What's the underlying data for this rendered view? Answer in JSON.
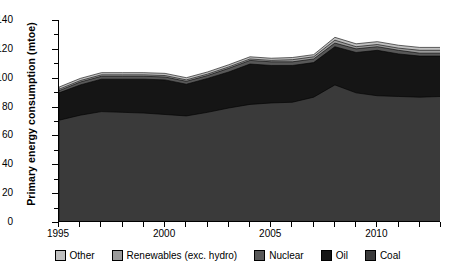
{
  "chart_data": {
    "type": "area",
    "title": "",
    "xlabel": "",
    "ylabel": "Primary energy consumption (mtoe)",
    "ylim": [
      0,
      140
    ],
    "xlim": [
      1995,
      2013
    ],
    "ytick_values": [
      0,
      20,
      40,
      60,
      80,
      100,
      120,
      140
    ],
    "xtick_values": [
      1995,
      2000,
      2005,
      2010
    ],
    "grid": false,
    "stacked": true,
    "legend_position": "bottom",
    "legend_order": [
      "Other",
      "Renewables (exc. hydro)",
      "Nuclear",
      "Oil",
      "Coal"
    ],
    "x": [
      1995,
      1996,
      1997,
      1998,
      1999,
      2000,
      2001,
      2002,
      2003,
      2004,
      2005,
      2006,
      2007,
      2008,
      2009,
      2010,
      2011,
      2012,
      2013
    ],
    "series": [
      {
        "name": "Coal",
        "color": "#3a3a3a",
        "values": [
          70.5,
          74.0,
          76.5,
          76.0,
          75.5,
          74.5,
          73.5,
          76.0,
          79.0,
          81.5,
          82.5,
          83.0,
          86.5,
          95.0,
          89.5,
          87.5,
          87.0,
          86.5,
          87.0
        ]
      },
      {
        "name": "Oil",
        "color": "#151515",
        "values": [
          19.0,
          21.0,
          22.5,
          23.0,
          23.5,
          24.0,
          22.0,
          23.5,
          25.0,
          28.0,
          26.0,
          25.5,
          24.0,
          26.5,
          28.0,
          31.5,
          29.5,
          28.5,
          28.0
        ]
      },
      {
        "name": "Nuclear",
        "color": "#585858",
        "values": [
          1.5,
          2.0,
          2.0,
          2.0,
          2.0,
          2.0,
          2.0,
          2.0,
          2.5,
          2.5,
          2.5,
          2.5,
          2.5,
          2.5,
          2.5,
          2.5,
          2.5,
          2.0,
          2.0
        ]
      },
      {
        "name": "Renewables (exc. hydro)",
        "color": "#9a9a9a",
        "values": [
          1.0,
          1.0,
          1.0,
          1.0,
          1.0,
          1.0,
          1.0,
          1.0,
          1.0,
          1.0,
          1.0,
          1.5,
          1.5,
          2.0,
          1.5,
          1.5,
          1.5,
          2.0,
          2.0
        ]
      },
      {
        "name": "Other",
        "color": "#c0c0c0",
        "values": [
          1.5,
          1.5,
          1.5,
          1.5,
          1.5,
          1.5,
          1.5,
          1.5,
          1.5,
          1.5,
          1.5,
          1.5,
          1.5,
          2.0,
          2.0,
          2.0,
          2.0,
          2.0,
          2.0
        ]
      }
    ],
    "totals": [
      93.5,
      99.5,
      103.5,
      103.5,
      103.5,
      103.0,
      100.0,
      104.0,
      109.0,
      114.5,
      113.5,
      114.0,
      116.0,
      128.0,
      123.5,
      125.0,
      122.5,
      121.0,
      121.0
    ]
  },
  "axes": {
    "y_title": "Primary energy consumption (mtoe)",
    "y_labels": [
      "0",
      "20",
      "40",
      "60",
      "80",
      "100",
      "120",
      "140"
    ],
    "x_labels": [
      "1995",
      "2000",
      "2005",
      "2010"
    ]
  },
  "legend": {
    "items": [
      {
        "label": "Other",
        "swatch": "#c0c0c0"
      },
      {
        "label": "Renewables (exc. hydro)",
        "swatch": "#9a9a9a"
      },
      {
        "label": "Nuclear",
        "swatch": "#585858"
      },
      {
        "label": "Oil",
        "swatch": "#151515"
      },
      {
        "label": "Coal",
        "swatch": "#3a3a3a"
      }
    ]
  }
}
